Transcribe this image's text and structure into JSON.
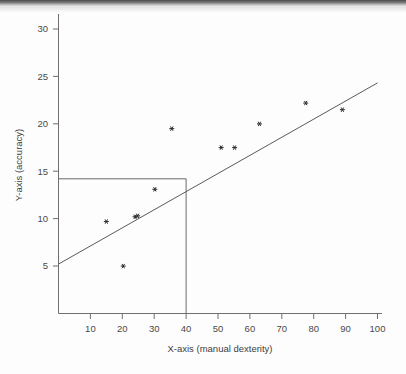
{
  "figure": {
    "background_color": "#ffffff",
    "ink_color": "#4a4a4a"
  },
  "chart_data": {
    "type": "scatter",
    "title": "",
    "xlabel": "X-axis (manual dexterity)",
    "ylabel": "Y-axis (accuracy)",
    "xlim": [
      0,
      103
    ],
    "ylim": [
      0,
      31.5
    ],
    "grid": false,
    "legend": null,
    "x_ticks": [
      10,
      20,
      30,
      40,
      50,
      60,
      70,
      80,
      90,
      100
    ],
    "x_tick_labels": [
      "10",
      "20",
      "30",
      "40",
      "50",
      "60",
      "70",
      "80",
      "90",
      "100"
    ],
    "y_ticks": [
      5,
      10,
      15,
      20,
      25,
      30
    ],
    "y_tick_labels": [
      "5",
      "10",
      "15",
      "20",
      "25",
      "30"
    ],
    "marker_style": "asterisk",
    "points": [
      {
        "x": 15.0,
        "y": 9.7
      },
      {
        "x": 20.3,
        "y": 5.0
      },
      {
        "x": 24.0,
        "y": 10.2
      },
      {
        "x": 24.8,
        "y": 10.3
      },
      {
        "x": 30.2,
        "y": 13.1
      },
      {
        "x": 35.5,
        "y": 19.5
      },
      {
        "x": 51.0,
        "y": 17.5
      },
      {
        "x": 55.2,
        "y": 17.5
      },
      {
        "x": 63.0,
        "y": 20.0
      },
      {
        "x": 77.5,
        "y": 22.2
      },
      {
        "x": 89.0,
        "y": 21.5
      }
    ],
    "series": [
      {
        "name": "observations",
        "x": [
          15.0,
          20.3,
          24.0,
          24.8,
          30.2,
          35.5,
          51.0,
          55.2,
          63.0,
          77.5,
          89.0
        ],
        "values": [
          9.7,
          5.0,
          10.2,
          10.3,
          13.1,
          19.5,
          17.5,
          17.5,
          20.0,
          22.2,
          21.5
        ]
      }
    ],
    "fit_line": {
      "name": "regression-line",
      "x_start": 0.0,
      "y_start": 5.4,
      "x_end": 100.0,
      "y_end": 24.5,
      "slope": 0.191,
      "intercept": 5.4
    },
    "annotations": [
      {
        "name": "prediction-reference-box",
        "type": "rectangle",
        "x_from": 0,
        "x_to": 40,
        "y_from": 0,
        "y_to": 13.8,
        "note": "vertical line at x=40 meets horizontal line at y=13.8 on the fit line"
      }
    ]
  }
}
